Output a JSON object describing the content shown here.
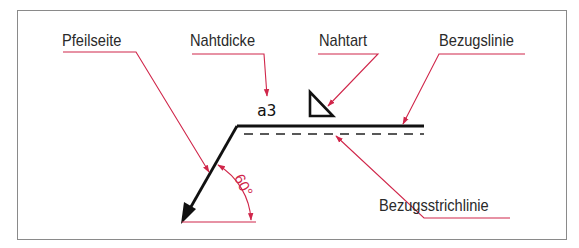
{
  "diagram": {
    "labels": {
      "arrow_side": "Pfeilseite",
      "weld_thickness": "Nahtdicke",
      "weld_type": "Nahtart",
      "reference_line": "Bezugslinie",
      "reference_dashed_line": "Bezugsstrichlinie"
    },
    "weld_dimension": "a3",
    "angle": "60°",
    "weld_symbol": "fillet-weld-triangle",
    "colors": {
      "annotation": "#d0264a",
      "drawing": "#111111",
      "frame": "#8a8a8a",
      "text": "#2a2a2a"
    }
  }
}
